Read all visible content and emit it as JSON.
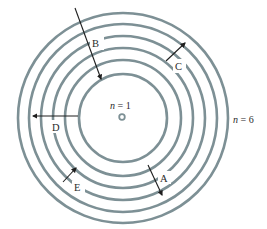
{
  "diagram": {
    "type": "bohr-model-energy-levels",
    "center": {
      "x": 123,
      "y": 118
    },
    "colors": {
      "ring": "#7d9095",
      "arrow": "#1e1e1e",
      "text": "#2a2a2a",
      "background": "#ffffff"
    },
    "levels": [
      {
        "n": 1,
        "radius": 3
      },
      {
        "n": 2,
        "radius": 44
      },
      {
        "n": 3,
        "radius": 58
      },
      {
        "n": 4,
        "radius": 70
      },
      {
        "n": 5,
        "radius": 82
      },
      {
        "n": 6,
        "radius": 94
      },
      {
        "n": 7,
        "radius": 105
      }
    ],
    "level_labels": {
      "inner": {
        "var": "n",
        "eq": " = ",
        "value": "1"
      },
      "outer": {
        "var": "n",
        "eq": " = ",
        "value": "6"
      }
    },
    "transitions": [
      {
        "label": "B",
        "direction": "inward",
        "from": [
          75,
          8
        ],
        "to": [
          101,
          79
        ]
      },
      {
        "label": "C",
        "direction": "outward",
        "from": [
          166,
          60
        ],
        "to": [
          185,
          43
        ]
      },
      {
        "label": "D",
        "direction": "outward",
        "from": [
          78,
          115
        ],
        "to": [
          33,
          115
        ]
      },
      {
        "label": "E",
        "direction": "outward",
        "from": [
          63,
          182
        ],
        "to": [
          76,
          168
        ]
      },
      {
        "label": "A",
        "direction": "inward",
        "from": [
          148,
          165
        ],
        "to": [
          162,
          195
        ]
      }
    ]
  }
}
